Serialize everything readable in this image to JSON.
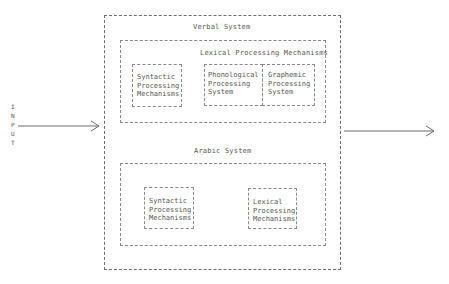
{
  "input": {
    "letters": [
      "I",
      "N",
      "P",
      "U",
      "T"
    ]
  },
  "verbal_system": {
    "title": "Verbal System",
    "lexical": {
      "title": "Lexical Processing Mechanisms",
      "phonological": [
        "Phonological",
        "Processing",
        "System"
      ],
      "graphemic": [
        "Graphemic",
        "Processing",
        "System"
      ]
    },
    "syntactic": [
      "Syntactic",
      "Processing",
      "Mechanisms"
    ]
  },
  "arabic_system": {
    "title": "Arabic System",
    "syntactic": [
      "Syntactic",
      "Processing",
      "Mechanisms"
    ],
    "lexical": [
      "Lexical",
      "Processing",
      "Mechanisms"
    ]
  },
  "colors": {
    "line": "#6e6e6e",
    "text": "#555555"
  }
}
